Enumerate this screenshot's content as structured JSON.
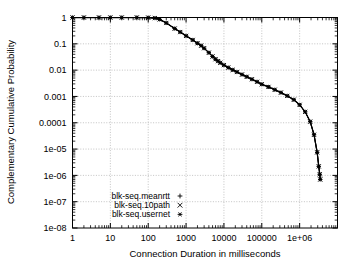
{
  "chart_data": {
    "type": "line",
    "title": "",
    "xlabel": "Connection Duration in milliseconds",
    "ylabel": "Complementary Cumulative Probability",
    "xscale": "log",
    "yscale": "log",
    "xlim": [
      1,
      10000000
    ],
    "ylim": [
      1e-08,
      1
    ],
    "grid": true,
    "xticks": [
      "1",
      "10",
      "100",
      "1000",
      "10000",
      "100000",
      "1e+06"
    ],
    "xtick_values": [
      1,
      10,
      100,
      1000,
      10000,
      100000,
      1000000
    ],
    "yticks": [
      "1",
      "0.1",
      "0.01",
      "0.001",
      "0.0001",
      "1e-05",
      "1e-06",
      "1e-07",
      "1e-08"
    ],
    "ytick_values": [
      1,
      0.1,
      0.01,
      0.001,
      0.0001,
      1e-05,
      1e-06,
      1e-07,
      1e-08
    ],
    "legend_position": "bottom-left",
    "series": [
      {
        "name": "blk-seq.meanrtt",
        "marker": "+",
        "color": "#000000",
        "x": [
          1,
          2,
          5,
          10,
          20,
          50,
          100,
          150,
          200,
          300,
          500,
          700,
          1000,
          1500,
          2000,
          2500,
          3000,
          4000,
          5000,
          6000,
          7000,
          8000,
          10000,
          13000,
          17000,
          22000,
          30000,
          40000,
          55000,
          75000,
          100000,
          150000,
          220000,
          320000,
          470000,
          700000,
          1000000,
          1400000,
          1900000,
          2400000,
          2900000,
          3200000,
          3400000,
          3500000
        ],
        "y": [
          1.0,
          1.0,
          1.0,
          1.0,
          1.0,
          1.0,
          0.99,
          0.95,
          0.85,
          0.62,
          0.38,
          0.28,
          0.2,
          0.14,
          0.105,
          0.085,
          0.068,
          0.046,
          0.033,
          0.026,
          0.022,
          0.019,
          0.0155,
          0.0125,
          0.0102,
          0.0085,
          0.0068,
          0.0056,
          0.0045,
          0.0036,
          0.0029,
          0.0023,
          0.0018,
          0.0014,
          0.00105,
          0.00075,
          0.00048,
          0.00026,
          0.00011,
          3.5e-05,
          7.5e-06,
          2.2e-06,
          1.1e-06,
          7e-07
        ]
      },
      {
        "name": "blk-seq.10path",
        "marker": "×",
        "color": "#000000",
        "x": [
          1,
          2,
          5,
          10,
          20,
          50,
          100,
          150,
          200,
          300,
          500,
          700,
          1000,
          1500,
          2000,
          2500,
          3000,
          4000,
          5000,
          6000,
          7000,
          8000,
          10000,
          13000,
          17000,
          22000,
          30000,
          40000,
          55000,
          75000,
          100000,
          150000,
          220000,
          320000,
          470000,
          700000,
          1000000,
          1400000,
          1900000,
          2400000,
          2900000,
          3200000,
          3400000,
          3500000
        ],
        "y": [
          1.0,
          1.0,
          1.0,
          1.0,
          1.0,
          1.0,
          0.99,
          0.95,
          0.85,
          0.62,
          0.38,
          0.28,
          0.2,
          0.14,
          0.105,
          0.085,
          0.068,
          0.046,
          0.033,
          0.026,
          0.022,
          0.019,
          0.0155,
          0.0125,
          0.0102,
          0.0085,
          0.0068,
          0.0056,
          0.0045,
          0.0036,
          0.0029,
          0.0023,
          0.0018,
          0.0014,
          0.00105,
          0.00075,
          0.00048,
          0.00026,
          0.00011,
          3.5e-05,
          7.5e-06,
          2.2e-06,
          1.1e-06,
          7e-07
        ]
      },
      {
        "name": "blk-seq.usernet",
        "marker": "*",
        "color": "#000000",
        "x": [
          1,
          2,
          5,
          10,
          20,
          50,
          100,
          150,
          200,
          300,
          500,
          700,
          1000,
          1500,
          2000,
          2500,
          3000,
          4000,
          5000,
          6000,
          7000,
          8000,
          10000,
          13000,
          17000,
          22000,
          30000,
          40000,
          55000,
          75000,
          100000,
          150000,
          220000,
          320000,
          470000,
          700000,
          1000000,
          1400000,
          1900000,
          2400000,
          2900000,
          3200000,
          3400000,
          3500000
        ],
        "y": [
          1.0,
          1.0,
          1.0,
          1.0,
          1.0,
          1.0,
          0.99,
          0.95,
          0.85,
          0.62,
          0.38,
          0.28,
          0.2,
          0.14,
          0.105,
          0.085,
          0.068,
          0.046,
          0.033,
          0.026,
          0.022,
          0.019,
          0.0155,
          0.0125,
          0.0102,
          0.0085,
          0.0068,
          0.0056,
          0.0045,
          0.0036,
          0.0029,
          0.0023,
          0.0018,
          0.0014,
          0.00105,
          0.00075,
          0.00048,
          0.00026,
          0.00011,
          3.5e-05,
          7.5e-06,
          2.2e-06,
          1.1e-06,
          7e-07
        ]
      }
    ]
  },
  "colors": {
    "axis": "#000000",
    "grid": "#b4b4b4",
    "curve": "#000000",
    "background": "#ffffff"
  }
}
